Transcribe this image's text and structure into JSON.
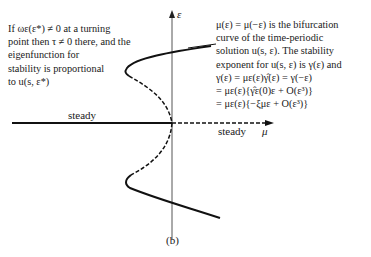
{
  "figure": {
    "caption": "(b)",
    "axes": {
      "vertical_label": "ε",
      "horizontal_label": "μ"
    },
    "branch_labels": {
      "steady_left": "steady",
      "steady_right": "steady"
    },
    "left_annotation": [
      "If ωε(ε*) ≠ 0 at a turning",
      "point then τ ≠ 0 there, and the",
      "eigenfunction for",
      "stability is proportional",
      "to u(s, ε*)"
    ],
    "right_annotation": [
      "μ(ε) = μ(−ε) is the bifurcation",
      "curve of the time-periodic",
      "solution u(s, ε). The stability",
      "exponent for u(s, ε) is γ(ε) and",
      "γ(ε) = με(ε)γ̂(ε) = γ(−ε)",
      "= με(ε){γ̂ε(0)ε + O(ε³)}",
      "= με(ε){−ξμε + O(ε³)}"
    ]
  }
}
